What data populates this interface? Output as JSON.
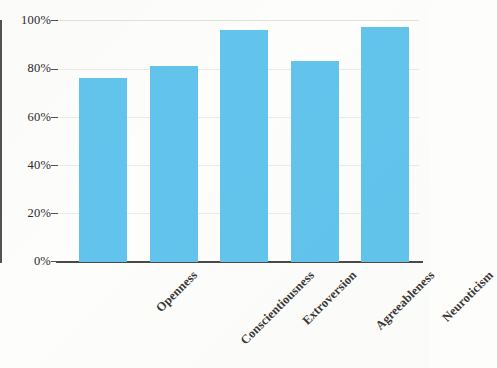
{
  "chart_data": {
    "type": "bar",
    "title": "",
    "subtitle": "",
    "xlabel": "",
    "ylabel": "",
    "categories": [
      "Openness",
      "Conscientiousness",
      "Extroversion",
      "Agreeableness",
      "Neuroticism"
    ],
    "values": [
      76,
      81,
      96,
      83,
      97
    ],
    "value_labels": [
      "76%",
      "81%",
      "96%",
      "83%",
      "97%"
    ],
    "ylim": [
      0,
      100
    ],
    "y_ticks": [
      0,
      20,
      40,
      60,
      80,
      100
    ],
    "y_tick_labels": [
      "0%",
      "20%",
      "40%",
      "60%",
      "80%",
      "100%"
    ],
    "series": [
      {
        "name": "",
        "values": [
          76,
          81,
          96,
          83,
          97
        ]
      }
    ],
    "grid": true,
    "legend": false,
    "legend_position": "none",
    "bar_color": "#62c4ec",
    "axis_color": "#4b4947",
    "gridline_color": "#eceae6",
    "background_color": "#fdfdfb",
    "x_tick_label_rotation": -45
  }
}
